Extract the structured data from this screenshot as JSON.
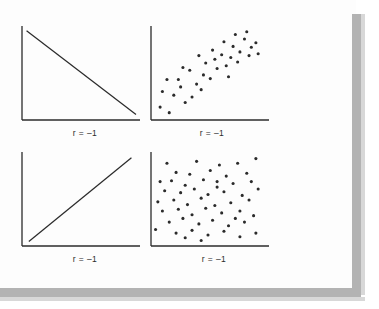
{
  "figure": {
    "background_color": "#fdfdfd",
    "ink_color": "#2b2b2b",
    "shadow_color": "#b3b3b3",
    "panel_count": 4
  },
  "chart_data": [
    {
      "id": "top-left",
      "type": "line",
      "title": "",
      "label": "r = –1",
      "correlation": -1,
      "description": "perfect negative linear relationship",
      "xlabel": "",
      "ylabel": "",
      "xlim": [
        0,
        100
      ],
      "ylim": [
        0,
        100
      ],
      "grid": false,
      "axes": [
        "left",
        "bottom"
      ],
      "x": [
        4,
        100
      ],
      "y": [
        97,
        6
      ]
    },
    {
      "id": "top-right",
      "type": "scatter",
      "title": "",
      "label": "r = –1",
      "correlation": 0.8,
      "description": "strong positive scatter",
      "xlabel": "",
      "ylabel": "",
      "xlim": [
        0,
        100
      ],
      "ylim": [
        0,
        100
      ],
      "grid": false,
      "axes": [
        "left",
        "bottom"
      ],
      "points": [
        [
          8,
          14
        ],
        [
          16,
          8
        ],
        [
          10,
          31
        ],
        [
          20,
          27
        ],
        [
          26,
          36
        ],
        [
          14,
          44
        ],
        [
          24,
          44
        ],
        [
          30,
          19
        ],
        [
          36,
          25
        ],
        [
          40,
          39
        ],
        [
          34,
          54
        ],
        [
          28,
          57
        ],
        [
          44,
          33
        ],
        [
          46,
          49
        ],
        [
          52,
          45
        ],
        [
          48,
          62
        ],
        [
          56,
          66
        ],
        [
          58,
          56
        ],
        [
          42,
          70
        ],
        [
          54,
          76
        ],
        [
          62,
          71
        ],
        [
          66,
          59
        ],
        [
          70,
          68
        ],
        [
          64,
          85
        ],
        [
          72,
          80
        ],
        [
          76,
          63
        ],
        [
          78,
          74
        ],
        [
          82,
          88
        ],
        [
          86,
          70
        ],
        [
          88,
          79
        ],
        [
          92,
          84
        ],
        [
          74,
          93
        ],
        [
          84,
          96
        ],
        [
          94,
          72
        ],
        [
          68,
          47
        ]
      ]
    },
    {
      "id": "bottom-left",
      "type": "line",
      "title": "",
      "label": "r = –1",
      "correlation": 1,
      "description": "perfect positive linear relationship",
      "xlabel": "",
      "ylabel": "",
      "xlim": [
        0,
        100
      ],
      "ylim": [
        0,
        100
      ],
      "grid": false,
      "axes": [
        "left",
        "bottom"
      ],
      "x": [
        6,
        96
      ],
      "y": [
        5,
        96
      ]
    },
    {
      "id": "bottom-right",
      "type": "scatter",
      "title": "",
      "label": "r = –1",
      "correlation": 0,
      "description": "no correlation, uniform random scatter",
      "xlabel": "",
      "ylabel": "",
      "xlim": [
        0,
        100
      ],
      "ylim": [
        0,
        100
      ],
      "grid": false,
      "axes": [
        "left",
        "bottom"
      ],
      "points": [
        [
          14,
          90
        ],
        [
          40,
          92
        ],
        [
          60,
          88
        ],
        [
          76,
          90
        ],
        [
          92,
          95
        ],
        [
          22,
          80
        ],
        [
          34,
          78
        ],
        [
          52,
          82
        ],
        [
          66,
          76
        ],
        [
          84,
          79
        ],
        [
          8,
          70
        ],
        [
          18,
          71
        ],
        [
          30,
          66
        ],
        [
          46,
          72
        ],
        [
          58,
          64
        ],
        [
          72,
          68
        ],
        [
          88,
          70
        ],
        [
          12,
          60
        ],
        [
          26,
          58
        ],
        [
          38,
          62
        ],
        [
          50,
          56
        ],
        [
          64,
          59
        ],
        [
          80,
          55
        ],
        [
          94,
          62
        ],
        [
          6,
          48
        ],
        [
          20,
          50
        ],
        [
          32,
          45
        ],
        [
          44,
          52
        ],
        [
          56,
          44
        ],
        [
          70,
          47
        ],
        [
          86,
          50
        ],
        [
          10,
          38
        ],
        [
          24,
          40
        ],
        [
          36,
          34
        ],
        [
          48,
          41
        ],
        [
          62,
          36
        ],
        [
          78,
          38
        ],
        [
          90,
          33
        ],
        [
          16,
          26
        ],
        [
          28,
          30
        ],
        [
          42,
          24
        ],
        [
          54,
          28
        ],
        [
          68,
          22
        ],
        [
          82,
          26
        ],
        [
          4,
          18
        ],
        [
          22,
          14
        ],
        [
          36,
          17
        ],
        [
          50,
          12
        ],
        [
          64,
          16
        ],
        [
          78,
          10
        ],
        [
          92,
          14
        ],
        [
          44,
          6
        ],
        [
          30,
          9
        ],
        [
          74,
          30
        ],
        [
          58,
          70
        ]
      ]
    }
  ]
}
